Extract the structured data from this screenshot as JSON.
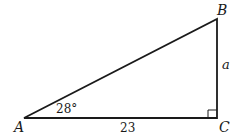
{
  "diagram": {
    "type": "right-triangle",
    "vertices": {
      "A": {
        "label": "A"
      },
      "B": {
        "label": "B"
      },
      "C": {
        "label": "C"
      }
    },
    "angle_A": "28°",
    "side_AC": "23",
    "side_BC": "a",
    "right_angle_at": "C",
    "stroke_color": "#1a1a1a"
  }
}
